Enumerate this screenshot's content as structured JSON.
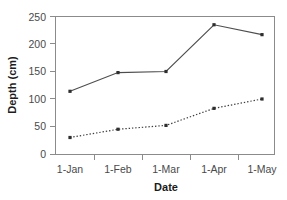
{
  "chart_data": {
    "type": "line",
    "title": "",
    "xlabel": "Date",
    "ylabel": "Depth (cm)",
    "categories": [
      "1-Jan",
      "1-Feb",
      "1-Mar",
      "1-Apr",
      "1-May"
    ],
    "ylim": [
      0,
      250
    ],
    "yticks": [
      0,
      50,
      100,
      150,
      200,
      250
    ],
    "ytick_labels": [
      "0",
      "50",
      "100",
      "150",
      "200",
      "250"
    ],
    "grid": false,
    "legend": "none",
    "series": [
      {
        "name": "solid-series",
        "style": "solid",
        "color": "#4d4d4d",
        "marker": "square",
        "values": [
          114,
          148,
          150,
          235,
          217
        ]
      },
      {
        "name": "dotted-series",
        "style": "dotted",
        "color": "#3d3d3d",
        "marker": "square",
        "values": [
          30,
          45,
          52,
          83,
          100
        ]
      }
    ]
  },
  "axes": {
    "y_title": "Depth (cm)",
    "x_title": "Date"
  }
}
